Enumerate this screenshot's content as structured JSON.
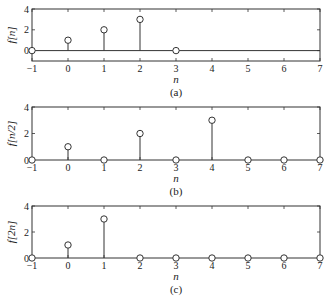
{
  "chart_data": [
    {
      "type": "stem",
      "panel": "(a)",
      "title": "",
      "xlabel": "n",
      "ylabel": "f[n]",
      "caption": "(a)",
      "xlim": [
        -1,
        7
      ],
      "ylim": [
        -1,
        4
      ],
      "xticks": [
        -1,
        0,
        1,
        2,
        3,
        4,
        5,
        6,
        7
      ],
      "yticks": [
        0,
        2,
        4
      ],
      "x": [
        -1,
        0,
        1,
        2,
        3
      ],
      "values": [
        0,
        1,
        2,
        3,
        0
      ],
      "grid": false,
      "zero_line": true
    },
    {
      "type": "stem",
      "panel": "(b)",
      "title": "",
      "xlabel": "n",
      "ylabel": "f[n/2]",
      "caption": "(b)",
      "xlim": [
        -1,
        7
      ],
      "ylim": [
        0,
        4
      ],
      "xticks": [
        -1,
        0,
        1,
        2,
        3,
        4,
        5,
        6,
        7
      ],
      "yticks": [
        0,
        2,
        4
      ],
      "x": [
        -1,
        0,
        1,
        2,
        3,
        4,
        5,
        6,
        7
      ],
      "values": [
        0,
        1,
        0,
        2,
        0,
        3,
        0,
        0,
        0
      ],
      "grid": false,
      "zero_line": false
    },
    {
      "type": "stem",
      "panel": "(c)",
      "title": "",
      "xlabel": "n",
      "ylabel": "f[2n]",
      "caption": "(c)",
      "xlim": [
        -1,
        7
      ],
      "ylim": [
        0,
        4
      ],
      "xticks": [
        -1,
        0,
        1,
        2,
        3,
        4,
        5,
        6,
        7
      ],
      "yticks": [
        0,
        2,
        4
      ],
      "x": [
        -1,
        0,
        1,
        2,
        3,
        4,
        5,
        6,
        7
      ],
      "values": [
        0,
        1,
        3,
        0,
        0,
        0,
        0,
        0,
        0
      ],
      "grid": false,
      "zero_line": false
    }
  ],
  "panels": [
    {
      "ylabel": "f[n]",
      "xlabel": "n",
      "caption": "(a)"
    },
    {
      "ylabel": "f[n/2]",
      "xlabel": "n",
      "caption": "(b)"
    },
    {
      "ylabel": "f[2n]",
      "xlabel": "n",
      "caption": "(c)"
    }
  ],
  "style": {
    "line_color": "#333333",
    "marker_fill": "#ffffff"
  }
}
